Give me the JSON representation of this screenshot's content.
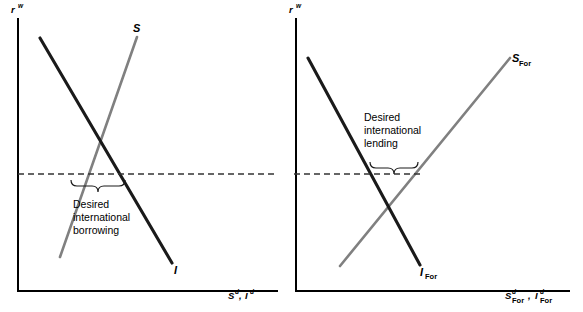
{
  "figure": {
    "title": "",
    "type": "economics-loanable-funds-two-panel-diagram",
    "background_color": "#ffffff",
    "colors": {
      "investment_curve": "#1a1a1a",
      "saving_curve": "#808080",
      "axis": "#000000",
      "dashed_line": "#333333",
      "text": "#000000"
    }
  },
  "panels": [
    {
      "id": "home",
      "name": "home-country-panel",
      "y_axis_label": "r",
      "y_axis_superscript": "w",
      "x_axis_label_parts": [
        {
          "base": "S",
          "sup": "d"
        },
        {
          "base": "I",
          "sup": "d"
        }
      ],
      "x_axis_label_text": "S d, I d",
      "curves": [
        {
          "name": "saving-curve",
          "label": "S",
          "subscript": "",
          "color": "#808080",
          "slope": "upward",
          "x1": 60,
          "y1": 257,
          "x2": 137,
          "y2": 37
        },
        {
          "name": "investment-curve",
          "label": "I",
          "subscript": "",
          "color": "#1a1a1a",
          "slope": "downward",
          "x1": 40,
          "y1": 38,
          "x2": 172,
          "y2": 263
        }
      ],
      "world_rate_line": {
        "name": "world-interest-rate-line",
        "style": "dashed",
        "y": 174,
        "x_start": 18,
        "x_end": 278
      },
      "brace": {
        "name": "desired-international-borrowing-brace",
        "orientation": "down",
        "x_start": 71,
        "x_end": 124,
        "y": 182
      },
      "annotation": {
        "name": "desired-international-borrowing-label",
        "lines": [
          "Desired",
          "international",
          "borrowing"
        ],
        "x": 73,
        "y": 200
      }
    },
    {
      "id": "foreign",
      "name": "foreign-country-panel",
      "y_axis_label": "r",
      "y_axis_superscript": "w",
      "x_axis_label_parts": [
        {
          "base": "S",
          "sup": "d",
          "sub": "For"
        },
        {
          "base": "I",
          "sup": "d",
          "sub": "For"
        }
      ],
      "x_axis_label_text": "S d For, I d For",
      "curves": [
        {
          "name": "foreign-saving-curve",
          "label": "S",
          "subscript": "For",
          "color": "#808080",
          "slope": "upward",
          "x1": 340,
          "y1": 266,
          "x2": 510,
          "y2": 58
        },
        {
          "name": "foreign-investment-curve",
          "label": "I",
          "subscript": "For",
          "color": "#1a1a1a",
          "slope": "downward",
          "x1": 308,
          "y1": 58,
          "x2": 420,
          "y2": 265
        }
      ],
      "world_rate_line": {
        "name": "world-interest-rate-line",
        "style": "dashed",
        "y": 174,
        "x_start": 294,
        "x_end": 424
      },
      "brace": {
        "name": "desired-international-lending-brace",
        "orientation": "down",
        "x_start": 370,
        "x_end": 418,
        "y": 164
      },
      "annotation": {
        "name": "desired-international-lending-label",
        "lines": [
          "Desired",
          "international",
          "lending"
        ],
        "x": 364,
        "y": 120
      }
    }
  ]
}
